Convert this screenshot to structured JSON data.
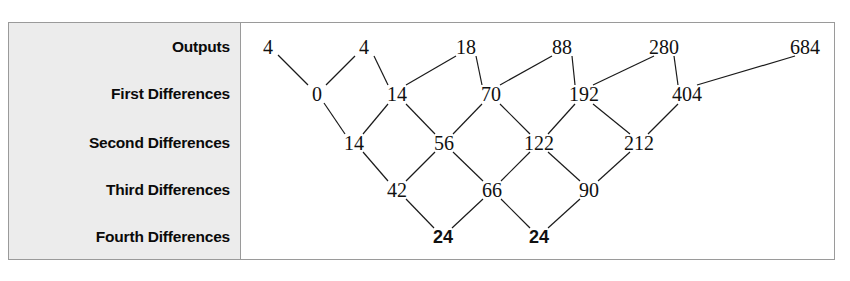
{
  "panel": {
    "row_labels": [
      {
        "label": "Outputs",
        "y": 24
      },
      {
        "label": "First Differences",
        "y": 71
      },
      {
        "label": "Second Differences",
        "y": 120
      },
      {
        "label": "Third Differences",
        "y": 167
      },
      {
        "label": "Fourth Differences",
        "y": 214
      }
    ],
    "background_color": "#ececec",
    "border_color": "#9a9a9a"
  },
  "chart_data": {
    "type": "diagram",
    "rows": [
      {
        "name": "Outputs",
        "values": [
          4,
          4,
          18,
          88,
          280,
          684
        ]
      },
      {
        "name": "First Differences",
        "values": [
          0,
          14,
          70,
          192,
          404
        ]
      },
      {
        "name": "Second Differences",
        "values": [
          14,
          56,
          122,
          212
        ]
      },
      {
        "name": "Third Differences",
        "values": [
          42,
          66,
          90
        ]
      },
      {
        "name": "Fourth Differences",
        "values": [
          24,
          24
        ]
      }
    ],
    "emphasized": {
      "row": "Fourth Differences",
      "values": [
        24,
        24
      ],
      "style": "bold"
    },
    "legend": [],
    "xlabel": "",
    "ylabel": "",
    "grid": false
  },
  "nodes": [
    {
      "text": "4",
      "x": 26,
      "y": 24,
      "bold": false
    },
    {
      "text": "4",
      "x": 122,
      "y": 24,
      "bold": false
    },
    {
      "text": "18",
      "x": 224,
      "y": 24,
      "bold": false
    },
    {
      "text": "88",
      "x": 320,
      "y": 24,
      "bold": false
    },
    {
      "text": "280",
      "x": 422,
      "y": 24,
      "bold": false
    },
    {
      "text": "684",
      "x": 563,
      "y": 24,
      "bold": false
    },
    {
      "text": "0",
      "x": 75,
      "y": 71,
      "bold": false
    },
    {
      "text": "14",
      "x": 155,
      "y": 71,
      "bold": false
    },
    {
      "text": "70",
      "x": 249,
      "y": 71,
      "bold": false
    },
    {
      "text": "192",
      "x": 342,
      "y": 71,
      "bold": false
    },
    {
      "text": "404",
      "x": 445,
      "y": 71,
      "bold": false
    },
    {
      "text": "14",
      "x": 112,
      "y": 120,
      "bold": false
    },
    {
      "text": "56",
      "x": 202,
      "y": 120,
      "bold": false
    },
    {
      "text": "122",
      "x": 297,
      "y": 120,
      "bold": false
    },
    {
      "text": "212",
      "x": 397,
      "y": 120,
      "bold": false
    },
    {
      "text": "42",
      "x": 155,
      "y": 167,
      "bold": false
    },
    {
      "text": "66",
      "x": 250,
      "y": 167,
      "bold": false
    },
    {
      "text": "90",
      "x": 347,
      "y": 167,
      "bold": false
    },
    {
      "text": "24",
      "x": 201,
      "y": 214,
      "bold": true
    },
    {
      "text": "24",
      "x": 297,
      "y": 214,
      "bold": true
    }
  ],
  "edges": [
    {
      "x1": 36,
      "y1": 32,
      "x2": 66,
      "y2": 62
    },
    {
      "x1": 84,
      "y1": 62,
      "x2": 113,
      "y2": 33
    },
    {
      "x1": 132,
      "y1": 33,
      "x2": 146,
      "y2": 62
    },
    {
      "x1": 164,
      "y1": 62,
      "x2": 214,
      "y2": 33
    },
    {
      "x1": 234,
      "y1": 33,
      "x2": 240,
      "y2": 62
    },
    {
      "x1": 258,
      "y1": 62,
      "x2": 310,
      "y2": 33
    },
    {
      "x1": 330,
      "y1": 33,
      "x2": 333,
      "y2": 62
    },
    {
      "x1": 351,
      "y1": 62,
      "x2": 412,
      "y2": 33
    },
    {
      "x1": 432,
      "y1": 33,
      "x2": 436,
      "y2": 62
    },
    {
      "x1": 455,
      "y1": 62,
      "x2": 553,
      "y2": 33
    },
    {
      "x1": 82,
      "y1": 80,
      "x2": 103,
      "y2": 111
    },
    {
      "x1": 121,
      "y1": 111,
      "x2": 146,
      "y2": 81
    },
    {
      "x1": 164,
      "y1": 81,
      "x2": 193,
      "y2": 111
    },
    {
      "x1": 211,
      "y1": 111,
      "x2": 240,
      "y2": 81
    },
    {
      "x1": 258,
      "y1": 81,
      "x2": 288,
      "y2": 111
    },
    {
      "x1": 306,
      "y1": 111,
      "x2": 333,
      "y2": 81
    },
    {
      "x1": 351,
      "y1": 81,
      "x2": 388,
      "y2": 111
    },
    {
      "x1": 406,
      "y1": 111,
      "x2": 436,
      "y2": 81
    },
    {
      "x1": 121,
      "y1": 129,
      "x2": 146,
      "y2": 158
    },
    {
      "x1": 164,
      "y1": 158,
      "x2": 193,
      "y2": 129
    },
    {
      "x1": 211,
      "y1": 129,
      "x2": 241,
      "y2": 158
    },
    {
      "x1": 259,
      "y1": 158,
      "x2": 288,
      "y2": 129
    },
    {
      "x1": 306,
      "y1": 129,
      "x2": 338,
      "y2": 158
    },
    {
      "x1": 356,
      "y1": 158,
      "x2": 388,
      "y2": 129
    },
    {
      "x1": 164,
      "y1": 176,
      "x2": 192,
      "y2": 205
    },
    {
      "x1": 210,
      "y1": 205,
      "x2": 241,
      "y2": 176
    },
    {
      "x1": 259,
      "y1": 176,
      "x2": 288,
      "y2": 205
    },
    {
      "x1": 306,
      "y1": 205,
      "x2": 338,
      "y2": 176
    }
  ]
}
